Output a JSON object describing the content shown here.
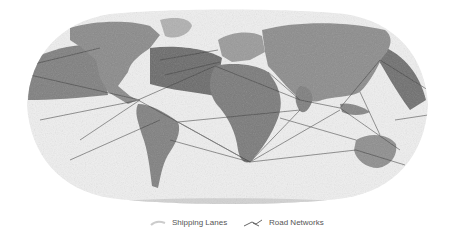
{
  "map": {
    "projection": "robinson",
    "style": "grayscale",
    "colors": {
      "background": "#ffffff",
      "ocean": "#eeeeee",
      "land": "#8f8f8f",
      "land_light": "#b5b5b5",
      "ice": "#d2d2d2",
      "lanes": "#3a3a3a",
      "lanes_dense": "#2b2b2b"
    }
  },
  "legend": {
    "items": [
      {
        "label": "Shipping Lanes",
        "icon": "shipping-lanes-swatch"
      },
      {
        "label": "Road Networks",
        "icon": "road-networks-line"
      }
    ]
  }
}
